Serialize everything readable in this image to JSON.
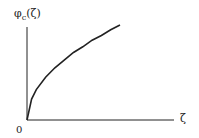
{
  "chart_data": {
    "type": "line",
    "title": "",
    "ylabel": "φc(ζ)",
    "ylabel_parts": {
      "symbol": "φ",
      "subscript": "c",
      "argument": "(ζ)"
    },
    "xlabel": "ζ",
    "origin_label": "0",
    "grid": false,
    "legend": null,
    "series": [
      {
        "name": "φc(ζ)",
        "description": "concave increasing curve starting at origin",
        "x": [
          0,
          0.05,
          0.1,
          0.2,
          0.3,
          0.4,
          0.5,
          0.6,
          0.7,
          0.8,
          0.9,
          1.0
        ],
        "y": [
          0,
          0.22,
          0.32,
          0.45,
          0.55,
          0.63,
          0.71,
          0.77,
          0.84,
          0.89,
          0.95,
          1.0
        ]
      }
    ],
    "xlim": [
      0,
      1.6
    ],
    "ylim": [
      0,
      1.1
    ]
  },
  "labels": {
    "y_symbol": "φ",
    "y_sub": "c",
    "y_arg": "(ζ)",
    "x": "ζ",
    "origin": "0"
  }
}
